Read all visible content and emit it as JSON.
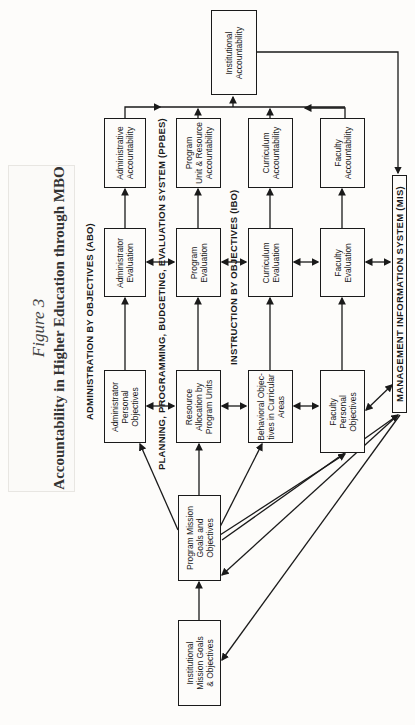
{
  "figure": {
    "label": "Figure 3",
    "title": "Accountability in Higher Education through MBO",
    "orientation": "rotated 90° counter-clockwise"
  },
  "sections": {
    "abo": "ADMINISTRATION BY OBJECTIVES (ABO)",
    "ppbes": "PLANNING, PROGRAMMING, BUDGETING, EVALUATION SYSTEM (PPBES)",
    "ibo": "INSTRUCTION BY OBJECTIVES (IBO)",
    "mis": "MANAGEMENT INFORMATION SYSTEM (MIS)"
  },
  "nodes": {
    "institutional_mission": [
      "Institutional",
      "Mission Goals",
      "& Objectives"
    ],
    "program_mission": [
      "Program Mission",
      "Goals and",
      "Objectives"
    ],
    "admin_personal": [
      "Administrator",
      "Personal",
      "Objectives"
    ],
    "admin_eval": [
      "Administrator",
      "Evaluation"
    ],
    "admin_acct": [
      "Administrative",
      "Accountability"
    ],
    "resource_alloc": [
      "Resource",
      "Allocation by",
      "Program Units"
    ],
    "program_eval": [
      "Program",
      "Evaluation"
    ],
    "program_acct": [
      "Program",
      "Unit & Resource",
      "Accountability"
    ],
    "behavioral": [
      "Behavioral Objec-",
      "tives in Curricular",
      "Areas"
    ],
    "curriculum_eval": [
      "Curriculum",
      "Evaluation"
    ],
    "curriculum_acct": [
      "Curriculum",
      "Accountability"
    ],
    "faculty_personal": [
      "Faculty",
      "Personal",
      "Objectives"
    ],
    "faculty_eval": [
      "Faculty",
      "Evaluation"
    ],
    "faculty_acct": [
      "Faculty",
      "Accountability"
    ],
    "institutional_acct": [
      "Institutional",
      "Accountability"
    ]
  },
  "colors": {
    "ink": "#1a1a1a",
    "paper": "#fdfcfa",
    "title_ink": "#333333"
  }
}
